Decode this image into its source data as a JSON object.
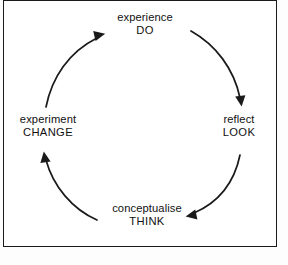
{
  "diagram": {
    "type": "cycle",
    "orientation": "clockwise",
    "shape": "circular-loop",
    "border_color": "#1a1a1a",
    "stroke_color": "#1a1a1a",
    "background_color": "#ffffff",
    "nodes": [
      {
        "id": "experience",
        "position": "top",
        "primary": "experience",
        "secondary": "DO"
      },
      {
        "id": "reflect",
        "position": "right",
        "primary": "reflect",
        "secondary": "LOOK"
      },
      {
        "id": "conceptualise",
        "position": "bottom",
        "primary": "conceptualise",
        "secondary": "THINK"
      },
      {
        "id": "experiment",
        "position": "left",
        "primary": "experiment",
        "secondary": "CHANGE"
      }
    ],
    "arrows": [
      {
        "id": "arrow-experience-to-reflect",
        "from": "experience",
        "to": "reflect",
        "direction": "clockwise"
      },
      {
        "id": "arrow-reflect-to-conceptualise",
        "from": "reflect",
        "to": "conceptualise",
        "direction": "clockwise"
      },
      {
        "id": "arrow-conceptualise-to-experiment",
        "from": "conceptualise",
        "to": "experiment",
        "direction": "clockwise"
      },
      {
        "id": "arrow-experiment-to-experience",
        "from": "experiment",
        "to": "experience",
        "direction": "clockwise"
      }
    ]
  }
}
